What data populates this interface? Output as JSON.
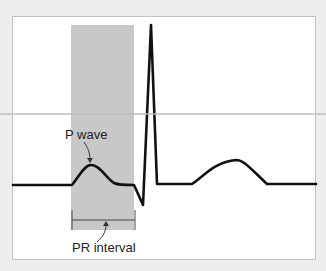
{
  "diagram": {
    "labels": {
      "p_wave": "P wave",
      "pr_interval": "PR interval"
    },
    "components": [
      "P wave",
      "QRS complex",
      "T wave",
      "PR interval (shaded)"
    ],
    "colors": {
      "trace": "#111111",
      "shaded_interval": "#c8c8c8",
      "frame_bg": "#ffffff",
      "page_bg": "#eeeeec",
      "annotation": "#333333"
    }
  }
}
